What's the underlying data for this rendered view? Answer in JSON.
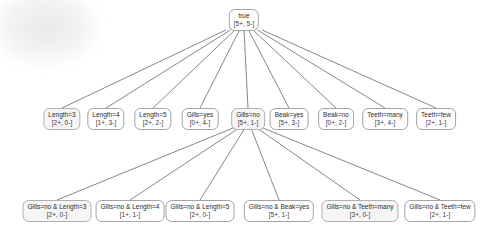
{
  "figure": {
    "type": "rule-refinement-search-tree",
    "background": "#ffffff",
    "edge_color": "#5f5f5f",
    "node_border_color": "#a3a3a3",
    "node_fill": "#ffffff",
    "node_fill_highlight": "#f5f5f5",
    "text_color": "#2b2b2b"
  },
  "tree": {
    "root": {
      "label": "true",
      "counts": "[5+, 5-]",
      "x": 244,
      "y": 9,
      "h": 21,
      "highlight": false
    },
    "level1_parent": "true",
    "level1": [
      {
        "label": "Length=3",
        "counts": "[2+, 0-]",
        "x": 62,
        "y": 108,
        "highlight": true
      },
      {
        "label": "Length=4",
        "counts": "[1+, 3-]",
        "x": 106,
        "y": 108,
        "highlight": false
      },
      {
        "label": "Length=5",
        "counts": "[2+, 2-]",
        "x": 153,
        "y": 108,
        "highlight": false
      },
      {
        "label": "Gills=yes",
        "counts": "[0+, 4-]",
        "x": 200,
        "y": 108,
        "highlight": false
      },
      {
        "label": "Gills=no",
        "counts": "[5+, 1-]",
        "x": 248,
        "y": 108,
        "highlight": true
      },
      {
        "label": "Beak=yes",
        "counts": "[5+, 3-]",
        "x": 289,
        "y": 108,
        "highlight": false
      },
      {
        "label": "Beak=no",
        "counts": "[0+, 2-]",
        "x": 336,
        "y": 108,
        "highlight": false
      },
      {
        "label": "Teeth=many",
        "counts": "[3+, 4-]",
        "x": 385,
        "y": 108,
        "highlight": false
      },
      {
        "label": "Teeth=few",
        "counts": "[2+, 1-]",
        "x": 436,
        "y": 108,
        "highlight": false
      }
    ],
    "level2_parent": "Gills=no",
    "level2": [
      {
        "label": "Gills=no & Length=3",
        "counts": "[2+, 0-]",
        "x": 57,
        "y": 200,
        "highlight": true
      },
      {
        "label": "Gills=no & Length=4",
        "counts": "[1+, 1-]",
        "x": 130,
        "y": 200,
        "highlight": false
      },
      {
        "label": "Gills=no & Length=5",
        "counts": "[2+, 0-]",
        "x": 200,
        "y": 200,
        "highlight": false
      },
      {
        "label": "Gills=no & Beak=yes",
        "counts": "[5+, 1-]",
        "x": 279,
        "y": 200,
        "highlight": false
      },
      {
        "label": "Gills=no & Teeth=many",
        "counts": "[3+, 0-]",
        "x": 360,
        "y": 200,
        "highlight": true
      },
      {
        "label": "Gills=no & Teeth=few",
        "counts": "[2+, 1-]",
        "x": 440,
        "y": 200,
        "highlight": false
      }
    ]
  }
}
